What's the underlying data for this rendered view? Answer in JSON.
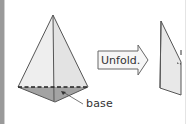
{
  "figure": {
    "pyramid": {
      "label": "base",
      "face_fill": "#ececec",
      "base_fill": "#9e9e9e",
      "edge_color": "#555555"
    },
    "arrow": {
      "label": "Unfold.",
      "fill": "#f4f4f4",
      "stroke": "#666666"
    },
    "net_partial": {
      "fill": "#e6e6e6",
      "stroke": "#555555"
    }
  }
}
